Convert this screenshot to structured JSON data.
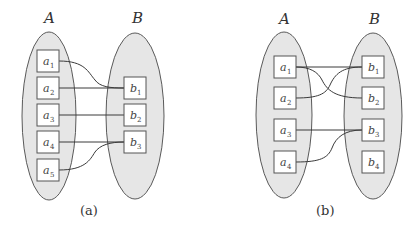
{
  "diagrams": [
    {
      "id": "a",
      "caption": "(a)",
      "set_a_label": "A",
      "set_b_label": "B",
      "set_a_nodes": [
        {
          "name": "a",
          "sub": "1"
        },
        {
          "name": "a",
          "sub": "2"
        },
        {
          "name": "a",
          "sub": "3"
        },
        {
          "name": "a",
          "sub": "4"
        },
        {
          "name": "a",
          "sub": "5"
        }
      ],
      "set_b_nodes": [
        {
          "name": "b",
          "sub": "1"
        },
        {
          "name": "b",
          "sub": "2"
        },
        {
          "name": "b",
          "sub": "3"
        }
      ],
      "edges": [
        [
          "a1",
          "b1"
        ],
        [
          "a2",
          "b1"
        ],
        [
          "a3",
          "b2"
        ],
        [
          "a4",
          "b3"
        ],
        [
          "a5",
          "b3"
        ]
      ]
    },
    {
      "id": "b",
      "caption": "(b)",
      "set_a_label": "A",
      "set_b_label": "B",
      "set_a_nodes": [
        {
          "name": "a",
          "sub": "1"
        },
        {
          "name": "a",
          "sub": "2"
        },
        {
          "name": "a",
          "sub": "3"
        },
        {
          "name": "a",
          "sub": "4"
        }
      ],
      "set_b_nodes": [
        {
          "name": "b",
          "sub": "1"
        },
        {
          "name": "b",
          "sub": "2"
        },
        {
          "name": "b",
          "sub": "3"
        },
        {
          "name": "b",
          "sub": "4"
        }
      ],
      "edges": [
        [
          "a1",
          "b1"
        ],
        [
          "a1",
          "b2"
        ],
        [
          "a2",
          "b1"
        ],
        [
          "a3",
          "b3"
        ],
        [
          "a4",
          "b3"
        ]
      ]
    }
  ],
  "colors": {
    "ellipse_fill": "#e6e6e6",
    "ellipse_stroke": "#5a5a5a",
    "box_fill": "#ffffff",
    "edge": "#3a3a3a"
  }
}
